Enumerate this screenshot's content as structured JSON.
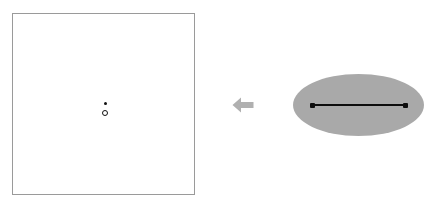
{
  "canvas": {
    "width": 426,
    "height": 210,
    "background_color": "#ffffff"
  },
  "figure": {
    "type": "geometric-diagram",
    "direction": "right-to-left",
    "panel_count": 2
  },
  "left_panel": {
    "name": "bordered-square-region",
    "shape": "rectangle",
    "border_color": "#9a9a9a",
    "border_width_px": 1,
    "fill_color": "#ffffff",
    "x": 12,
    "y": 13,
    "width": 183,
    "height": 182,
    "contents": [
      {
        "name": "filled-point",
        "shape": "dot",
        "style": "filled",
        "color": "#111111",
        "center_x": 104,
        "center_y": 102,
        "diameter_px": 3
      },
      {
        "name": "hollow-circle",
        "shape": "circle",
        "style": "outline",
        "color": "#111111",
        "center_x": 104,
        "center_y": 112,
        "diameter_px": 6
      }
    ]
  },
  "arrow": {
    "name": "leftward-arrow",
    "direction": "left",
    "color": "#b0b0b0",
    "x": 232,
    "y": 96,
    "width": 22,
    "height": 18
  },
  "right_panel": {
    "name": "shaded-ellipse-region",
    "shape": "ellipse",
    "fill_color": "#a9a9a9",
    "center_x": 358,
    "center_y": 105,
    "width": 131,
    "height": 62,
    "contents": [
      {
        "name": "horizontal-segment",
        "shape": "line-segment",
        "color": "#0d0d0d",
        "x1": 312,
        "y1": 105,
        "x2": 405,
        "y2": 105,
        "length_px": 93,
        "thickness_px": 2
      },
      {
        "name": "segment-endpoint-left",
        "shape": "dot",
        "style": "filled",
        "color": "#0d0d0d",
        "center_x": 312,
        "center_y": 105,
        "size_px": 5
      },
      {
        "name": "segment-endpoint-right",
        "shape": "dot",
        "style": "filled",
        "color": "#0d0d0d",
        "center_x": 405,
        "center_y": 105,
        "size_px": 5
      }
    ]
  }
}
